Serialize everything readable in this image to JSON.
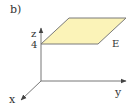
{
  "diagram": {
    "subfigure_label": "b)",
    "axes": {
      "x_label": "x",
      "y_label": "y",
      "z_label": "z"
    },
    "z_tick": "4",
    "plane": {
      "label": "E",
      "description": "plane z = 4",
      "fill_color": "#fbf3b8",
      "edge_color": "#7a7a7a"
    },
    "axis_color": "#777777"
  }
}
